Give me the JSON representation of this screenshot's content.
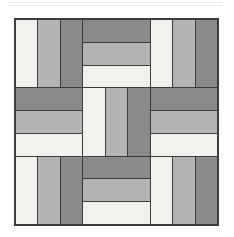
{
  "canvas": {
    "background": "#ffffff"
  },
  "top_separator": {
    "style": "dotted",
    "color": "#d6d6d6"
  },
  "quilt_block": {
    "pattern": "rail-fence",
    "grid_rows": 3,
    "grid_cols": 3,
    "rails_per_unit": 3,
    "outline_color": "#3c3c3c",
    "palette": {
      "light": "#f1f1ee",
      "medium": "#b4b4b4",
      "dark": "#8a8a8a"
    },
    "units": [
      {
        "row": 0,
        "col": 0,
        "orientation": "vertical",
        "stripes": [
          "light",
          "medium",
          "dark"
        ]
      },
      {
        "row": 0,
        "col": 1,
        "orientation": "horizontal",
        "stripes": [
          "dark",
          "medium",
          "light"
        ]
      },
      {
        "row": 0,
        "col": 2,
        "orientation": "vertical",
        "stripes": [
          "light",
          "medium",
          "dark"
        ]
      },
      {
        "row": 1,
        "col": 0,
        "orientation": "horizontal",
        "stripes": [
          "dark",
          "medium",
          "light"
        ]
      },
      {
        "row": 1,
        "col": 1,
        "orientation": "vertical",
        "stripes": [
          "light",
          "medium",
          "dark"
        ]
      },
      {
        "row": 1,
        "col": 2,
        "orientation": "horizontal",
        "stripes": [
          "dark",
          "medium",
          "light"
        ]
      },
      {
        "row": 2,
        "col": 0,
        "orientation": "vertical",
        "stripes": [
          "light",
          "medium",
          "dark"
        ]
      },
      {
        "row": 2,
        "col": 1,
        "orientation": "horizontal",
        "stripes": [
          "dark",
          "medium",
          "light"
        ]
      },
      {
        "row": 2,
        "col": 2,
        "orientation": "vertical",
        "stripes": [
          "light",
          "medium",
          "dark"
        ]
      }
    ]
  }
}
